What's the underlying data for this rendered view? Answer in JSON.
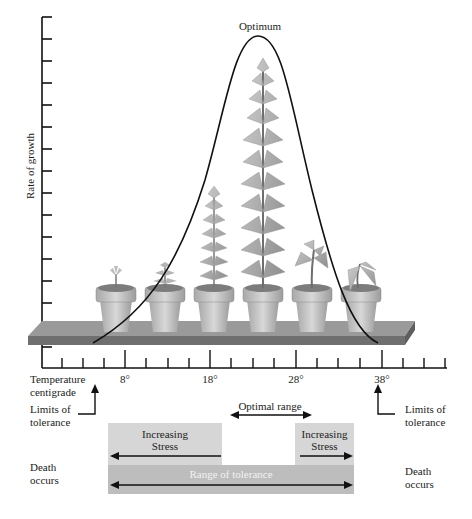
{
  "figure": {
    "peak_label": "Optimum",
    "y_axis_label": "Rate of growth",
    "x_axis_label_line1": "Temperature",
    "x_axis_label_line2": "centigrade",
    "x_tick_labels": [
      "8°",
      "18°",
      "28°",
      "38°"
    ],
    "limits_left_line1": "Limits of",
    "limits_left_line2": "tolerance",
    "limits_right_line1": "Limits of",
    "limits_right_line2": "tolerance",
    "optimal_range_label": "Optimal range",
    "stress_left_line1": "Increasing",
    "stress_left_line2": "Stress",
    "stress_right_line1": "Increasing",
    "stress_right_line2": "Stress",
    "range_of_tolerance_label": "Range of tolerance",
    "death_left_line1": "Death",
    "death_left_line2": "occurs",
    "death_right_line1": "Death",
    "death_right_line2": "occurs",
    "plants": [
      {
        "position": 1,
        "state": "seedling"
      },
      {
        "position": 2,
        "state": "small"
      },
      {
        "position": 3,
        "state": "medium-tall"
      },
      {
        "position": 4,
        "state": "tallest"
      },
      {
        "position": 5,
        "state": "wilting"
      },
      {
        "position": 6,
        "state": "dying"
      }
    ],
    "colors": {
      "stress_bar": "#d6d6d6",
      "range_bar": "#bdbdbd",
      "shelf": "#8a8a8a",
      "curve": "#111111"
    }
  }
}
